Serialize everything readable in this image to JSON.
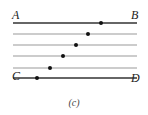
{
  "diagram": {
    "labels": {
      "top_left": "A",
      "top_right": "B",
      "bottom_left": "C",
      "bottom_right": "D"
    },
    "caption": "(c)",
    "lines": [
      {
        "y": 23,
        "x1": 13,
        "x2": 137,
        "color": "#333333",
        "width": 1.3,
        "dot_x": 101
      },
      {
        "y": 34,
        "x1": 13,
        "x2": 137,
        "color": "#999999",
        "width": 1.0,
        "dot_x": 88
      },
      {
        "y": 45,
        "x1": 13,
        "x2": 137,
        "color": "#999999",
        "width": 1.0,
        "dot_x": 76
      },
      {
        "y": 56,
        "x1": 13,
        "x2": 137,
        "color": "#999999",
        "width": 1.0,
        "dot_x": 63
      },
      {
        "y": 68,
        "x1": 13,
        "x2": 137,
        "color": "#999999",
        "width": 1.0,
        "dot_x": 50
      },
      {
        "y": 78,
        "x1": 13,
        "x2": 137,
        "color": "#333333",
        "width": 1.3,
        "dot_x": 37
      }
    ],
    "dot_color": "#111111"
  }
}
